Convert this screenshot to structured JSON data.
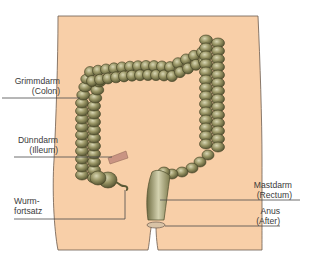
{
  "diagram": {
    "colors": {
      "skin": "#f8cfa8",
      "skin_outline": "#6b5a4e",
      "colon_dark": "#5b5a36",
      "colon_mid": "#8d8a5a",
      "colon_light": "#c9c7a4",
      "ileum": "#c99483",
      "leader_line": "#4a4a4a",
      "text": "#3a3a3a"
    },
    "labels": [
      {
        "id": "colon",
        "line1": "Grimmdarm",
        "line2": "(Colon)",
        "side": "left"
      },
      {
        "id": "ileum",
        "line1": "Dünndarm",
        "line2": "(Illeum)",
        "side": "left"
      },
      {
        "id": "appendix",
        "line1": "Wurm-",
        "line2": "fortsatz",
        "side": "left"
      },
      {
        "id": "rectum",
        "line1": "Mastdarm",
        "line2": "(Rectum)",
        "side": "right"
      },
      {
        "id": "anus",
        "line1": "Anus",
        "line2": "(After)",
        "side": "right"
      }
    ]
  }
}
